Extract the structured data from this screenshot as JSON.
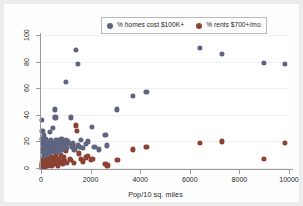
{
  "chart_data": {
    "type": "scatter",
    "title": "",
    "xlabel": "Pop/10 sq. miles",
    "ylabel": "",
    "xlim": [
      0,
      10000
    ],
    "ylim": [
      0,
      100
    ],
    "xticks": [
      0,
      2000,
      4000,
      6000,
      8000,
      10000
    ],
    "yticks": [
      0,
      20,
      40,
      60,
      80,
      100
    ],
    "xtick_labels": [
      "0",
      "2000",
      "4000",
      "6000",
      "8000",
      "10000"
    ],
    "ytick_labels": [
      "0",
      "20",
      "40",
      "60",
      "80",
      "100"
    ],
    "grid": "horizontal-faint",
    "legend_position": "top-center",
    "series": [
      {
        "name": "% homes cost $100K+",
        "color": "#5f6480",
        "marker": "circle",
        "points": [
          [
            40,
            36
          ],
          [
            55,
            28
          ],
          [
            60,
            22
          ],
          [
            70,
            18
          ],
          [
            75,
            14
          ],
          [
            90,
            20
          ],
          [
            100,
            12
          ],
          [
            110,
            16
          ],
          [
            120,
            9
          ],
          [
            130,
            25
          ],
          [
            140,
            19
          ],
          [
            150,
            11
          ],
          [
            165,
            15
          ],
          [
            175,
            22
          ],
          [
            185,
            13
          ],
          [
            200,
            17
          ],
          [
            215,
            20
          ],
          [
            230,
            12
          ],
          [
            245,
            16
          ],
          [
            260,
            10
          ],
          [
            280,
            14
          ],
          [
            300,
            19
          ],
          [
            320,
            13
          ],
          [
            340,
            17
          ],
          [
            360,
            27
          ],
          [
            380,
            15
          ],
          [
            400,
            21
          ],
          [
            420,
            12
          ],
          [
            440,
            18
          ],
          [
            460,
            14
          ],
          [
            480,
            30
          ],
          [
            500,
            16
          ],
          [
            520,
            19
          ],
          [
            545,
            44
          ],
          [
            560,
            13
          ],
          [
            580,
            38
          ],
          [
            600,
            17
          ],
          [
            620,
            21
          ],
          [
            650,
            15
          ],
          [
            680,
            20
          ],
          [
            700,
            12
          ],
          [
            740,
            18
          ],
          [
            780,
            16
          ],
          [
            820,
            22
          ],
          [
            860,
            14
          ],
          [
            900,
            19
          ],
          [
            950,
            17
          ],
          [
            1000,
            65
          ],
          [
            1020,
            21
          ],
          [
            1060,
            15
          ],
          [
            1100,
            20
          ],
          [
            1150,
            18
          ],
          [
            1200,
            38
          ],
          [
            1260,
            16
          ],
          [
            1300,
            19
          ],
          [
            1350,
            14
          ],
          [
            1420,
            89
          ],
          [
            1480,
            78
          ],
          [
            1500,
            17
          ],
          [
            1560,
            16
          ],
          [
            1620,
            21
          ],
          [
            1700,
            15
          ],
          [
            1800,
            18
          ],
          [
            1900,
            20
          ],
          [
            2050,
            31
          ],
          [
            2150,
            16
          ],
          [
            2350,
            14
          ],
          [
            2600,
            25
          ],
          [
            2650,
            17
          ],
          [
            3050,
            44
          ],
          [
            3700,
            54
          ],
          [
            4250,
            57
          ],
          [
            6400,
            90
          ],
          [
            7300,
            86
          ],
          [
            9000,
            79
          ],
          [
            9850,
            78
          ]
        ]
      },
      {
        "name": "% rents $700+/mo",
        "color": "#8c4133",
        "marker": "circle",
        "points": [
          [
            30,
            2
          ],
          [
            45,
            4
          ],
          [
            60,
            1
          ],
          [
            75,
            6
          ],
          [
            90,
            3
          ],
          [
            105,
            2
          ],
          [
            120,
            5
          ],
          [
            135,
            8
          ],
          [
            150,
            3
          ],
          [
            165,
            1
          ],
          [
            180,
            7
          ],
          [
            195,
            4
          ],
          [
            210,
            2
          ],
          [
            225,
            9
          ],
          [
            240,
            5
          ],
          [
            255,
            3
          ],
          [
            270,
            6
          ],
          [
            290,
            2
          ],
          [
            310,
            11
          ],
          [
            330,
            4
          ],
          [
            350,
            7
          ],
          [
            370,
            3
          ],
          [
            390,
            14
          ],
          [
            410,
            5
          ],
          [
            430,
            2
          ],
          [
            455,
            8
          ],
          [
            480,
            4
          ],
          [
            505,
            12
          ],
          [
            530,
            6
          ],
          [
            560,
            3
          ],
          [
            590,
            9
          ],
          [
            620,
            5
          ],
          [
            650,
            15
          ],
          [
            680,
            2
          ],
          [
            715,
            7
          ],
          [
            750,
            4
          ],
          [
            790,
            10
          ],
          [
            830,
            6
          ],
          [
            870,
            3
          ],
          [
            910,
            8
          ],
          [
            950,
            5
          ],
          [
            1000,
            13
          ],
          [
            1050,
            4
          ],
          [
            1100,
            19
          ],
          [
            1160,
            7
          ],
          [
            1220,
            6
          ],
          [
            1280,
            17
          ],
          [
            1340,
            4
          ],
          [
            1400,
            32
          ],
          [
            1460,
            28
          ],
          [
            1520,
            11
          ],
          [
            1560,
            16
          ],
          [
            1620,
            7
          ],
          [
            1700,
            5
          ],
          [
            1800,
            8
          ],
          [
            1900,
            9
          ],
          [
            2000,
            6
          ],
          [
            2070,
            7
          ],
          [
            2600,
            3
          ],
          [
            2680,
            2
          ],
          [
            3080,
            6
          ],
          [
            3700,
            14
          ],
          [
            4250,
            16
          ],
          [
            6400,
            19
          ],
          [
            7300,
            20
          ],
          [
            9000,
            7
          ],
          [
            9850,
            19
          ]
        ]
      }
    ]
  },
  "legend": {
    "entries": [
      {
        "label": "% homes cost $100K+",
        "color": "#5f6480"
      },
      {
        "label": "% rents $700+/mo",
        "color": "#8c4133"
      }
    ]
  },
  "axes": {
    "x_title": "Pop/10 sq. miles"
  }
}
